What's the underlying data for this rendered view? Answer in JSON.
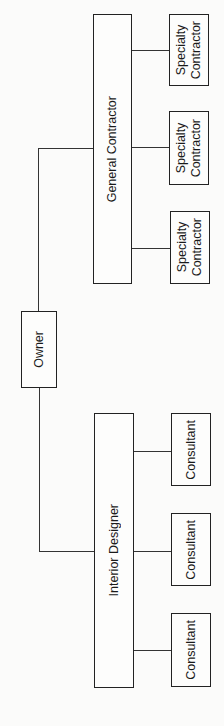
{
  "diagram": {
    "type": "org-chart",
    "orientation": "rotated-90-ccw",
    "root": {
      "label": "Owner"
    },
    "branches": [
      {
        "label": "General Contractor",
        "children": [
          {
            "label": "Specialty\nContractor"
          },
          {
            "label": "Specialty\nContractor"
          },
          {
            "label": "Specialty\nContractor"
          }
        ]
      },
      {
        "label": "Interior Designer",
        "children": [
          {
            "label": "Consultant"
          },
          {
            "label": "Consultant"
          },
          {
            "label": "Consultant"
          }
        ]
      }
    ],
    "colors": {
      "line": "#222222",
      "box_fill": "#fdfdfc",
      "background": "#fbfbfa"
    }
  }
}
